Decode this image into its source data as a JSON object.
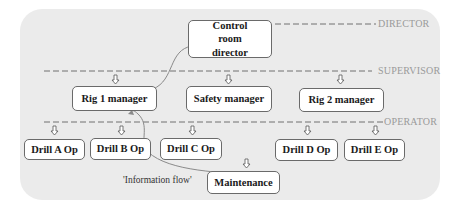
{
  "diagram": {
    "levels": [
      {
        "label": "DIRECTOR"
      },
      {
        "label": "SUPERVISOR"
      },
      {
        "label": "OPERATOR"
      }
    ],
    "nodes": {
      "control_room_director": "Control room director",
      "rig1_manager": "Rig 1 manager",
      "safety_manager": "Safety manager",
      "rig2_manager": "Rig 2 manager",
      "drill_a": "Drill A Op",
      "drill_b": "Drill B Op",
      "drill_c": "Drill C Op",
      "drill_d": "Drill D Op",
      "drill_e": "Drill E Op",
      "maintenance": "Maintenance"
    },
    "flow_caption": "'Information flow'",
    "flow_path": [
      "Maintenance",
      "Drill B Op",
      "Rig 1 manager",
      "Control room director"
    ],
    "colors": {
      "panel": "#ebebeb",
      "box_border": "#6a6a6a",
      "dash": "#707070",
      "level_label": "#9a9a9a",
      "flow_line": "#8a8a8a"
    }
  }
}
